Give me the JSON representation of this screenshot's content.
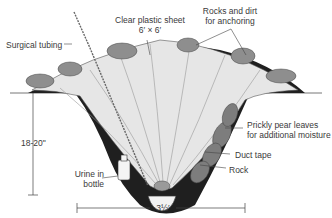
{
  "diagram": {
    "labels": {
      "surgical_tubing": "Surgical tubing",
      "plastic_sheet_line1": "Clear plastic sheet",
      "plastic_sheet_line2": "6′ × 6′",
      "rocks_line1": "Rocks and dirt",
      "rocks_line2": "for anchoring",
      "prickly_line1": "Prickly pear leaves",
      "prickly_line2": "for additional moisture",
      "duct_tape": "Duct tape",
      "rock": "Rock",
      "urine_line1": "Urine in",
      "urine_line2": "bottle",
      "depth": "18-20\"",
      "width": "3½′"
    },
    "colors": {
      "soil": "#1f1f1f",
      "rock": "#8e8e8e",
      "sheet": "#e4e4e4",
      "leaf": "#7a7a7a",
      "line": "#444444"
    }
  }
}
